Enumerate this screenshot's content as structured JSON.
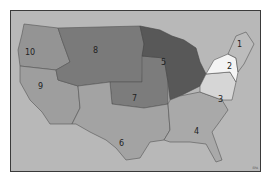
{
  "map": {
    "title": "U.S. EPA Regions",
    "background_color": "#b8b8b8",
    "border_color": "#3a3a3a",
    "credit": "EPA",
    "regions": [
      {
        "id": "1",
        "label": "1",
        "color": "#bcbcbc",
        "x": 237,
        "y": 44
      },
      {
        "id": "2",
        "label": "2",
        "color": "#f4f4f4",
        "x": 229,
        "y": 66
      },
      {
        "id": "3",
        "label": "3",
        "color": "#d6d6d6",
        "x": 220,
        "y": 100
      },
      {
        "id": "4",
        "label": "4",
        "color": "#a9a9a9",
        "x": 196,
        "y": 131
      },
      {
        "id": "5",
        "label": "5",
        "color": "#585858",
        "x": 163,
        "y": 62
      },
      {
        "id": "6",
        "label": "6",
        "color": "#a3a3a3",
        "x": 121,
        "y": 143
      },
      {
        "id": "7",
        "label": "7",
        "color": "#7c7c7c",
        "x": 134,
        "y": 98
      },
      {
        "id": "8",
        "label": "8",
        "color": "#7a7a7a",
        "x": 95,
        "y": 50
      },
      {
        "id": "9",
        "label": "9",
        "color": "#9e9e9e",
        "x": 40,
        "y": 86
      },
      {
        "id": "10",
        "label": "10",
        "color": "#949494",
        "x": 30,
        "y": 52
      }
    ]
  }
}
